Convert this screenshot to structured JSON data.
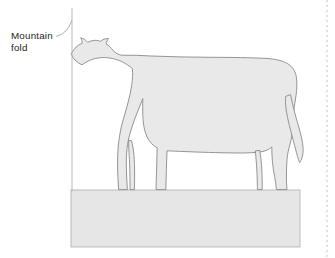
{
  "figure": {
    "name": "mountain-fold-cow-diagram",
    "caption_label": "Mountain\nfold",
    "label_line1": "Mountain",
    "label_line2": "fold",
    "base_shape": "rectangular-block",
    "fold_type": "Mountain fold",
    "colors": {
      "background": "#ffffff",
      "cow_fill": "#e9e9e9",
      "cow_stroke": "#8c8c8c",
      "block_fill": "#e6e6e6",
      "block_stroke": "#b3b3b3",
      "fold_line": "#b0b0b0",
      "leader_line": "#9a9a9a",
      "text": "#231f20",
      "page_edge": "#e2e2e2"
    },
    "fold_line": {
      "name": "mountain-fold-line",
      "orientation": "vertical",
      "x": 72,
      "y_top": 8,
      "y_bottom": 191
    },
    "leader": {
      "name": "label-leader-line",
      "from_x": 57,
      "from_y": 36,
      "to_x": 72,
      "to_y": 21
    },
    "block": {
      "name": "ground-block",
      "x": 71,
      "y": 190,
      "width": 229,
      "height": 57
    },
    "cow": {
      "name": "cow-silhouette",
      "bbox": {
        "x": 68,
        "y": 38,
        "width": 235,
        "height": 153
      },
      "parts": [
        "head",
        "ears",
        "muzzle",
        "neck",
        "body",
        "front-legs",
        "hind-legs",
        "tail",
        "udder-gap"
      ]
    }
  }
}
